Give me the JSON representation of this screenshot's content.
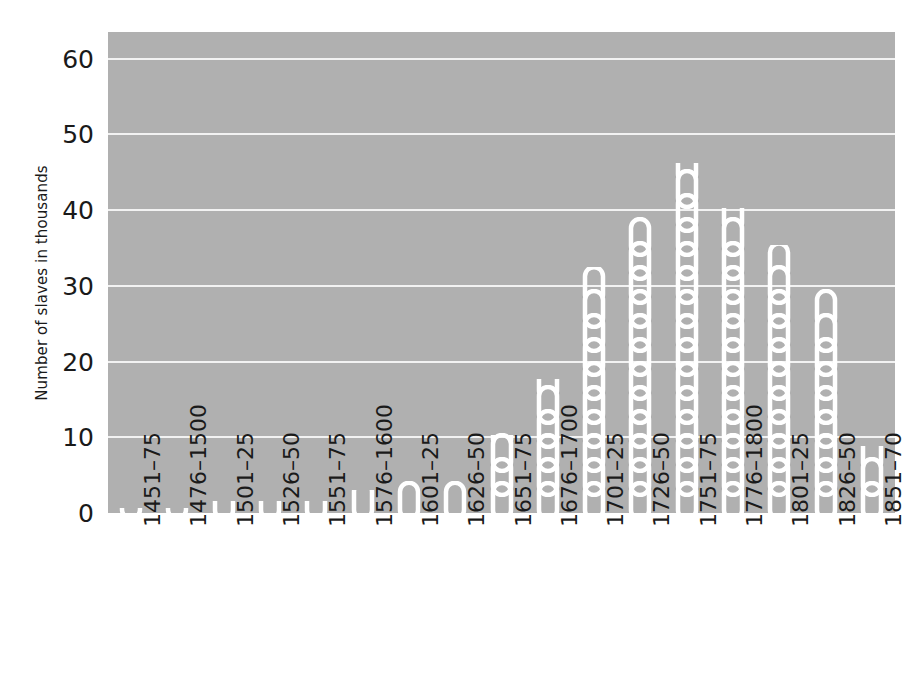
{
  "chart_data": {
    "type": "bar",
    "title": "",
    "subtitle": "",
    "xlabel": "",
    "ylabel": "Number of slaves in thousands",
    "categories": [
      "1451–75",
      "1476–1500",
      "1501–25",
      "1526–50",
      "1551–75",
      "1576–1600",
      "1601–25",
      "1626–50",
      "1651–75",
      "1676–1700",
      "1701–25",
      "1726–50",
      "1751–75",
      "1776–1800",
      "1801–25",
      "1826–50",
      "1851–70"
    ],
    "values": [
      0.6,
      0.6,
      1.6,
      1.6,
      1.6,
      3.0,
      4.2,
      4.2,
      13.5,
      23.0,
      42.0,
      51.0,
      61.0,
      53.0,
      46.0,
      38.0,
      11.0
    ],
    "ylim": [
      0,
      63.5
    ],
    "ytick_labels": [
      "0",
      "10",
      "20",
      "30",
      "40",
      "50",
      "60"
    ],
    "ytick_values": [
      0,
      10,
      20,
      30,
      40,
      50,
      60
    ],
    "grid": "horizontal",
    "legend": "none",
    "bar_style": "chain-links",
    "colors": {
      "plot_background": "#b0b0b0",
      "gridline": "#f2f2f2",
      "bar": "#ffffff",
      "text": "#1a1a1a",
      "figure_background": "#ffffff"
    }
  }
}
